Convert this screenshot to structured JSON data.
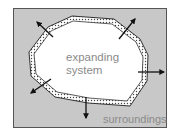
{
  "diagram": {
    "title": "",
    "inner_label_line1": "expanding",
    "inner_label_line2": "system",
    "outer_label": "surroundings",
    "colors": {
      "background": "#ffffff",
      "surroundings_fill": "#c8c8c8",
      "frame_stroke": "#555555",
      "system_fill": "#ffffff",
      "boundary": "#333333",
      "arrow": "#111111",
      "text": "#8a8a8a"
    },
    "arrows": [
      {
        "direction": "up-left"
      },
      {
        "direction": "up-right"
      },
      {
        "direction": "right"
      },
      {
        "direction": "down"
      },
      {
        "direction": "down-left"
      }
    ]
  }
}
